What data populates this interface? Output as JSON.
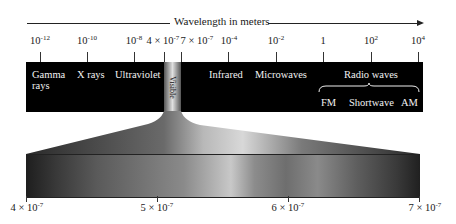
{
  "diagram": {
    "title": "Wavelength in meters",
    "top_axis": {
      "ticks": [
        {
          "base": "10",
          "exp": "-12",
          "x": 40
        },
        {
          "base": "10",
          "exp": "-10",
          "x": 87
        },
        {
          "base": "10",
          "exp": "-8",
          "x": 134
        },
        {
          "base": "4 × 10",
          "exp": "-7",
          "x": 164
        },
        {
          "base": "7 × 10",
          "exp": "-7",
          "x": 181
        },
        {
          "base": "10",
          "exp": "-4",
          "x": 228
        },
        {
          "base": "10",
          "exp": "-2",
          "x": 276
        },
        {
          "base": "1",
          "exp": "",
          "x": 323
        },
        {
          "base": "10",
          "exp": "2",
          "x": 371
        },
        {
          "base": "10",
          "exp": "4",
          "x": 418
        }
      ]
    },
    "regions": {
      "gamma": "Gamma",
      "gamma_line2": "rays",
      "xrays": "X rays",
      "ultraviolet": "Ultraviolet",
      "visible": "Visible",
      "infrared": "Infrared",
      "microwaves": "Microwaves",
      "radio": "Radio waves",
      "fm": "FM",
      "shortwave": "Shortwave",
      "am": "AM"
    },
    "bottom_axis": {
      "ticks": [
        {
          "base": "4 × 10",
          "exp": "-7"
        },
        {
          "base": "5 × 10",
          "exp": "-7"
        },
        {
          "base": "6 × 10",
          "exp": "-7"
        },
        {
          "base": "7 × 10",
          "exp": "-7"
        }
      ]
    },
    "colors": {
      "band": "#000000",
      "line": "#222222"
    }
  }
}
